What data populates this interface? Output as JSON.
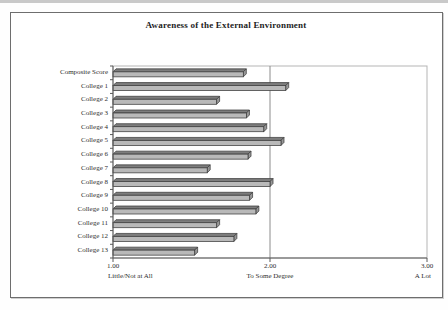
{
  "chart_data": {
    "type": "bar",
    "orientation": "horizontal",
    "title": "Awareness of the External Environment",
    "categories": [
      "Composite Score",
      "College 1",
      "College 2",
      "College 3",
      "College 4",
      "College 5",
      "College 6",
      "College 7",
      "College 8",
      "College 9",
      "College 10",
      "College 11",
      "College 12",
      "College 13"
    ],
    "values": [
      1.83,
      2.1,
      1.66,
      1.85,
      1.96,
      2.07,
      1.86,
      1.6,
      2.0,
      1.87,
      1.91,
      1.66,
      1.77,
      1.52
    ],
    "xlim": [
      1.0,
      3.0
    ],
    "x_ticks": [
      {
        "value": "1.00",
        "label": "Little/Not at All"
      },
      {
        "value": "2.00",
        "label": "To Some Degree"
      },
      {
        "value": "3.00",
        "label": "A Lot"
      }
    ],
    "gridlines": [
      2.0
    ],
    "legend": "none",
    "grid": "vertical-at-2.00-only",
    "colors": {
      "bar_front": "#b9b9b9",
      "bar_top": "#7d7d7d",
      "bar_side": "#989898",
      "bar_outline": "#3c3c3c",
      "axis_line": "#5a5a5a",
      "wall_border": "#b5b5b5",
      "gridline": "#8c8c8c",
      "frame_border": "#6e6e6e",
      "background": "#ffffff"
    }
  }
}
